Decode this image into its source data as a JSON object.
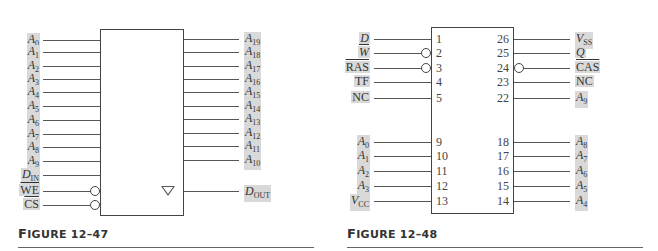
{
  "figure_47": {
    "caption_prefix": "F",
    "caption_rest": "IGURE 12–47",
    "left_pins": [
      {
        "base": "A",
        "sub": "0"
      },
      {
        "base": "A",
        "sub": "1"
      },
      {
        "base": "A",
        "sub": "2"
      },
      {
        "base": "A",
        "sub": "3"
      },
      {
        "base": "A",
        "sub": "4"
      },
      {
        "base": "A",
        "sub": "5"
      },
      {
        "base": "A",
        "sub": "6"
      },
      {
        "base": "A",
        "sub": "7"
      },
      {
        "base": "A",
        "sub": "8"
      },
      {
        "base": "A",
        "sub": "9"
      },
      {
        "base": "D",
        "sub": "IN"
      },
      {
        "base": "WE",
        "sub": "",
        "active_low": true
      },
      {
        "base": "CS",
        "sub": "",
        "active_low": true
      }
    ],
    "right_pins": [
      {
        "base": "A",
        "sub": "19"
      },
      {
        "base": "A",
        "sub": "18"
      },
      {
        "base": "A",
        "sub": "17"
      },
      {
        "base": "A",
        "sub": "16"
      },
      {
        "base": "A",
        "sub": "15"
      },
      {
        "base": "A",
        "sub": "14"
      },
      {
        "base": "A",
        "sub": "13"
      },
      {
        "base": "A",
        "sub": "12"
      },
      {
        "base": "A",
        "sub": "11"
      },
      {
        "base": "A",
        "sub": "10"
      }
    ],
    "output_pin": {
      "base": "D",
      "sub": "OUT"
    },
    "output_symbol": "tri-state-triangle"
  },
  "figure_48": {
    "caption_prefix": "F",
    "caption_rest": "IGURE 12–48",
    "left_pins": [
      {
        "num": "1",
        "base": "D",
        "sub": "",
        "italic": true
      },
      {
        "num": "2",
        "base": "W",
        "sub": "",
        "italic": true,
        "active_low": true
      },
      {
        "num": "3",
        "base": "RAS",
        "sub": "",
        "active_low": true
      },
      {
        "num": "4",
        "base": "TF",
        "sub": ""
      },
      {
        "num": "5",
        "base": "NC",
        "sub": ""
      },
      {
        "num": "9",
        "base": "A",
        "sub": "0",
        "italic": true
      },
      {
        "num": "10",
        "base": "A",
        "sub": "1",
        "italic": true
      },
      {
        "num": "11",
        "base": "A",
        "sub": "2",
        "italic": true
      },
      {
        "num": "12",
        "base": "A",
        "sub": "3",
        "italic": true
      },
      {
        "num": "13",
        "base": "V",
        "sub": "CC",
        "italic": true
      }
    ],
    "right_pins": [
      {
        "num": "26",
        "base": "V",
        "sub": "SS",
        "italic": true
      },
      {
        "num": "25",
        "base": "Q",
        "sub": "",
        "italic": true
      },
      {
        "num": "24",
        "base": "CAS",
        "sub": "",
        "active_low": true
      },
      {
        "num": "23",
        "base": "NC",
        "sub": ""
      },
      {
        "num": "22",
        "base": "A",
        "sub": "9",
        "italic": true
      },
      {
        "num": "18",
        "base": "A",
        "sub": "8",
        "italic": true
      },
      {
        "num": "17",
        "base": "A",
        "sub": "7",
        "italic": true
      },
      {
        "num": "16",
        "base": "A",
        "sub": "6",
        "italic": true
      },
      {
        "num": "15",
        "base": "A",
        "sub": "5",
        "italic": true
      },
      {
        "num": "14",
        "base": "A",
        "sub": "4",
        "italic": true
      }
    ]
  }
}
